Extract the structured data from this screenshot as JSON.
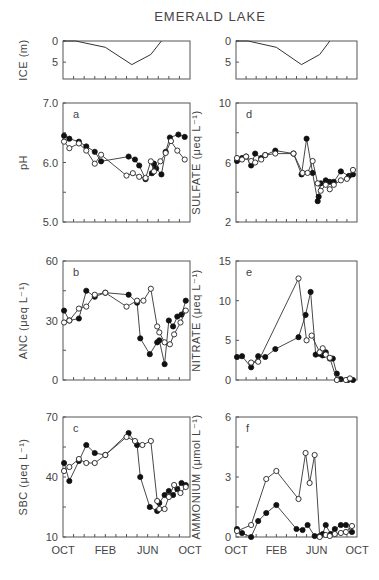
{
  "figure": {
    "title": "EMERALD LAKE",
    "x_tick_labels": [
      "OCT",
      "FEB",
      "JUN",
      "OCT"
    ],
    "x_tick_positions": [
      0,
      4,
      8,
      12
    ],
    "x_minor_ticks": [
      1,
      2,
      3,
      4,
      5,
      6,
      7,
      8,
      9,
      10,
      11
    ],
    "colors": {
      "ink": "#333333",
      "frame": "#555555",
      "filled_marker": "#111111",
      "open_marker": "#ffffff"
    }
  },
  "layout": {
    "columns": [
      {
        "x0": 63,
        "x1": 190
      },
      {
        "x0": 236,
        "x1": 357
      }
    ],
    "rows": [
      {
        "name": "ice",
        "y0": 41,
        "y1": 79
      },
      {
        "name": "row1",
        "y0": 103,
        "y1": 222
      },
      {
        "name": "row2",
        "y0": 261,
        "y1": 380
      },
      {
        "name": "row3",
        "y0": 417,
        "y1": 537
      }
    ]
  },
  "chart_data": [
    {
      "id": "ice-left",
      "type": "line",
      "title": "",
      "xlabel": "",
      "ylabel": "ICE (m)",
      "ylim": [
        0,
        9
      ],
      "y_inverted": true,
      "yticks": [
        0,
        5
      ],
      "ytick_labels": [
        "0",
        "5"
      ],
      "grid": false,
      "col": 0,
      "row": 0,
      "series": [
        {
          "name": "ice thickness",
          "x": [
            0,
            1.2,
            4.0,
            6.5,
            8.3,
            9.3
          ],
          "y": [
            0,
            0,
            1.5,
            5.6,
            3.2,
            0
          ]
        }
      ]
    },
    {
      "id": "ice-right",
      "type": "line",
      "title": "",
      "xlabel": "",
      "ylabel": "",
      "ylim": [
        0,
        9
      ],
      "y_inverted": true,
      "yticks": [
        0,
        5
      ],
      "ytick_labels": [
        "0",
        "5"
      ],
      "grid": false,
      "col": 1,
      "row": 0,
      "series": [
        {
          "name": "ice thickness",
          "x": [
            0,
            1.2,
            4.0,
            6.5,
            8.3,
            9.3
          ],
          "y": [
            0,
            0,
            1.5,
            5.6,
            3.2,
            0
          ]
        }
      ]
    },
    {
      "id": "a",
      "panel_letter": "a",
      "type": "line",
      "ylabel": "pH",
      "ylim": [
        5.0,
        7.0
      ],
      "yticks": [
        5.0,
        5.5,
        6.0,
        6.5,
        7.0
      ],
      "ytick_labels": [
        "5.0",
        "",
        "6.0",
        "",
        "7.0"
      ],
      "grid": false,
      "col": 0,
      "row": 1,
      "series": [
        {
          "name": "filled",
          "marker": "filled",
          "x": [
            0.1,
            0.6,
            1.5,
            2.2,
            3.0,
            3.6,
            6.2,
            6.8,
            7.2,
            7.8,
            8.4,
            8.6,
            8.8,
            9.3,
            9.7,
            10.1,
            10.9,
            11.5
          ],
          "y": [
            6.45,
            6.4,
            6.35,
            6.27,
            6.18,
            6.02,
            6.1,
            6.05,
            5.95,
            5.72,
            5.82,
            5.98,
            5.9,
            5.8,
            6.18,
            6.42,
            6.47,
            6.43
          ]
        },
        {
          "name": "open",
          "marker": "open",
          "x": [
            0.1,
            0.6,
            1.5,
            2.2,
            3.0,
            3.6,
            6.0,
            6.6,
            7.2,
            7.8,
            8.3,
            8.6,
            9.2,
            9.7,
            10.2,
            10.8,
            11.5
          ],
          "y": [
            6.35,
            6.24,
            6.32,
            6.2,
            5.98,
            6.13,
            5.78,
            5.82,
            5.76,
            5.74,
            6.02,
            5.85,
            6.02,
            6.16,
            6.36,
            6.2,
            6.05
          ]
        }
      ]
    },
    {
      "id": "d",
      "panel_letter": "d",
      "type": "line",
      "ylabel": "SULFATE (μeq L⁻¹)",
      "ylim": [
        2,
        10
      ],
      "yticks": [
        2,
        4,
        6,
        8,
        10
      ],
      "ytick_labels": [
        "2",
        "",
        "6",
        "",
        "10"
      ],
      "grid": false,
      "col": 1,
      "row": 1,
      "series": [
        {
          "name": "filled",
          "marker": "filled",
          "x": [
            0.1,
            0.6,
            1.0,
            1.5,
            1.9,
            2.5,
            2.9,
            3.9,
            5.7,
            6.5,
            7.0,
            7.6,
            8.1,
            8.2,
            8.4,
            8.9,
            9.3,
            9.7,
            10.4,
            11.2,
            11.6
          ],
          "y": [
            6.1,
            6.3,
            6.4,
            5.8,
            6.6,
            6.3,
            6.5,
            6.8,
            6.6,
            5.2,
            7.6,
            5.3,
            3.4,
            3.7,
            4.6,
            4.8,
            4.7,
            4.7,
            5.4,
            5.1,
            5.2
          ]
        },
        {
          "name": "open",
          "marker": "open",
          "x": [
            0.1,
            0.6,
            1.0,
            1.5,
            1.9,
            2.5,
            2.9,
            3.9,
            5.7,
            6.6,
            7.1,
            7.6,
            8.1,
            8.4,
            8.9,
            9.3,
            9.7,
            10.4,
            11.0,
            11.6
          ],
          "y": [
            6.3,
            6.2,
            6.4,
            6.1,
            6.0,
            6.2,
            6.5,
            6.6,
            6.6,
            5.3,
            5.3,
            6.1,
            4.6,
            4.1,
            4.5,
            4.2,
            4.5,
            4.8,
            4.9,
            5.5
          ]
        }
      ]
    },
    {
      "id": "b",
      "panel_letter": "b",
      "type": "line",
      "ylabel": "ANC (μeq L⁻¹)",
      "ylim": [
        0,
        60
      ],
      "yticks": [
        0,
        15,
        30,
        45,
        60
      ],
      "ytick_labels": [
        "0",
        "",
        "30",
        "",
        "60"
      ],
      "grid": false,
      "col": 0,
      "row": 2,
      "series": [
        {
          "name": "filled",
          "marker": "filled",
          "x": [
            0.1,
            0.6,
            1.5,
            2.2,
            3.0,
            4.0,
            6.2,
            7.0,
            7.3,
            8.2,
            8.9,
            9.1,
            9.6,
            10.0,
            10.4,
            10.8,
            11.2,
            11.6
          ],
          "y": [
            35,
            30,
            31,
            45,
            42,
            44,
            43,
            39,
            21,
            13,
            19,
            20,
            8,
            30,
            27,
            32,
            33,
            40
          ]
        },
        {
          "name": "open",
          "marker": "open",
          "x": [
            0.1,
            0.6,
            1.5,
            2.2,
            3.0,
            4.0,
            6.0,
            7.0,
            7.6,
            8.3,
            8.9,
            9.1,
            9.6,
            10.1,
            10.5,
            11.1,
            11.6
          ],
          "y": [
            29,
            30,
            36,
            37,
            43,
            44,
            37,
            40,
            40,
            46,
            27,
            24,
            19,
            18,
            23,
            29,
            35
          ]
        }
      ]
    },
    {
      "id": "e",
      "panel_letter": "e",
      "type": "line",
      "ylabel": "NITRATE (μeq L⁻¹)",
      "ylim": [
        0,
        15
      ],
      "yticks": [
        0,
        5,
        10,
        15
      ],
      "ytick_labels": [
        "0",
        "5",
        "10",
        "15"
      ],
      "grid": false,
      "col": 1,
      "row": 2,
      "series": [
        {
          "name": "filled",
          "marker": "filled",
          "x": [
            0.1,
            0.6,
            1.5,
            2.2,
            2.9,
            3.9,
            6.2,
            6.9,
            7.4,
            7.9,
            8.3,
            8.6,
            8.9,
            9.3,
            9.6,
            10.0,
            10.4,
            11.1,
            11.6
          ],
          "y": [
            2.9,
            3.0,
            1.6,
            3.0,
            2.9,
            3.9,
            5.4,
            8.2,
            11.1,
            3.2,
            3.3,
            3.1,
            3.5,
            2.7,
            2.7,
            0.8,
            0.1,
            0.0,
            0.0
          ]
        },
        {
          "name": "open",
          "marker": "open",
          "x": [
            1.5,
            2.2,
            6.2,
            7.0,
            7.5,
            8.3,
            8.6,
            8.9,
            9.3,
            10.0,
            10.9,
            11.3
          ],
          "y": [
            2.2,
            2.3,
            12.8,
            5.0,
            5.6,
            3.5,
            4.0,
            3.2,
            2.8,
            0.0,
            0.0,
            0.2
          ]
        }
      ]
    },
    {
      "id": "c",
      "panel_letter": "c",
      "type": "line",
      "xlabel": "",
      "ylabel": "SBC (μeq L⁻¹)",
      "ylim": [
        10,
        70
      ],
      "yticks": [
        10,
        25,
        40,
        55,
        70
      ],
      "ytick_labels": [
        "10",
        "",
        "40",
        "",
        "70"
      ],
      "grid": false,
      "col": 0,
      "row": 3,
      "series": [
        {
          "name": "filled",
          "marker": "filled",
          "x": [
            0.1,
            0.6,
            1.5,
            2.2,
            3.0,
            4.0,
            6.2,
            7.0,
            7.3,
            8.2,
            8.9,
            9.1,
            9.6,
            10.0,
            10.4,
            10.8,
            11.2,
            11.6
          ],
          "y": [
            47,
            38,
            48,
            56,
            52,
            51,
            62,
            56,
            40,
            25,
            23,
            27,
            31,
            33,
            31,
            34,
            37,
            36
          ]
        },
        {
          "name": "open",
          "marker": "open",
          "x": [
            0.1,
            0.6,
            1.5,
            2.2,
            3.0,
            4.0,
            6.0,
            6.8,
            7.5,
            8.3,
            8.9,
            9.1,
            9.6,
            10.0,
            10.5,
            11.1,
            11.6
          ],
          "y": [
            43,
            45,
            49,
            47,
            47,
            51,
            60,
            58,
            56,
            58,
            28,
            24,
            24,
            30,
            36,
            32,
            35
          ]
        }
      ]
    },
    {
      "id": "f",
      "panel_letter": "f",
      "type": "line",
      "xlabel": "",
      "ylabel": "AMMONIUM (μmol L⁻¹)",
      "ylim": [
        0,
        6
      ],
      "yticks": [
        0,
        1.5,
        3,
        4.5,
        6
      ],
      "ytick_labels": [
        "0",
        "",
        "3",
        "",
        "6"
      ],
      "grid": false,
      "col": 1,
      "row": 3,
      "series": [
        {
          "name": "filled",
          "marker": "filled",
          "x": [
            0.1,
            0.6,
            1.5,
            2.2,
            3.0,
            4.0,
            6.0,
            6.6,
            7.1,
            7.8,
            8.3,
            8.6,
            8.9,
            9.4,
            9.8,
            10.4,
            10.9,
            11.5
          ],
          "y": [
            0.4,
            0.2,
            0.0,
            0.8,
            1.2,
            1.6,
            0.4,
            0.35,
            0.6,
            0.05,
            0.05,
            0.15,
            0.6,
            0.15,
            0.4,
            0.6,
            0.6,
            0.25
          ]
        },
        {
          "name": "open",
          "marker": "open",
          "x": [
            0.1,
            1.5,
            3.0,
            4.0,
            6.2,
            6.9,
            7.3,
            7.8,
            8.3,
            8.9,
            9.3,
            9.8,
            10.4,
            10.9,
            11.5
          ],
          "y": [
            0.3,
            0.6,
            2.9,
            3.3,
            1.9,
            4.2,
            2.7,
            4.1,
            0.0,
            0.1,
            0.05,
            0.15,
            0.2,
            0.25,
            0.55
          ]
        }
      ]
    }
  ]
}
